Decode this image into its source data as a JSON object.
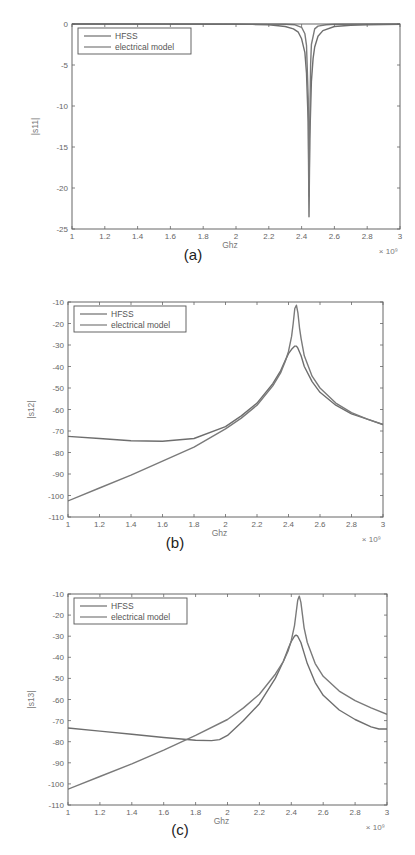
{
  "chart_data": [
    {
      "id": "a",
      "type": "line",
      "caption": "(a)",
      "xlabel": "Ghz",
      "ylabel": "|s11|",
      "x_multiplier": "× 10⁹",
      "xlim": [
        1,
        3
      ],
      "ylim": [
        -25,
        0
      ],
      "xticks": [
        1,
        1.2,
        1.4,
        1.6,
        1.8,
        2,
        2.2,
        2.4,
        2.6,
        2.8,
        3
      ],
      "xtick_labels": [
        "1",
        "1.2",
        "1.4",
        "1.6",
        "1.8",
        "2",
        "2.2",
        "2.4",
        "2.6",
        "2.8",
        "3"
      ],
      "yticks": [
        0,
        -5,
        -10,
        -15,
        -20,
        -25
      ],
      "ytick_labels": [
        "0",
        "-5",
        "-10",
        "-15",
        "-20",
        "-25"
      ],
      "legend": [
        "HFSS",
        "electrical model"
      ],
      "legend_position": "upper left",
      "grid": false,
      "series": [
        {
          "name": "HFSS",
          "color": "#6e6e6e",
          "x": [
            1,
            2.0,
            2.1,
            2.2,
            2.3,
            2.35,
            2.38,
            2.4,
            2.42,
            2.43,
            2.44,
            2.445,
            2.45,
            2.46,
            2.47,
            2.48,
            2.5,
            2.53,
            2.6,
            2.7,
            2.8,
            3
          ],
          "y": [
            0,
            -0.02,
            -0.05,
            -0.1,
            -0.3,
            -0.6,
            -1.0,
            -1.8,
            -3.5,
            -6,
            -12,
            -23.5,
            -14,
            -7,
            -4.2,
            -2.8,
            -1.5,
            -0.8,
            -0.3,
            -0.15,
            -0.08,
            -0.05
          ]
        },
        {
          "name": "electrical model",
          "color": "#7a7a7a",
          "x": [
            1,
            2.2,
            2.3,
            2.36,
            2.4,
            2.42,
            2.43,
            2.44,
            2.445,
            2.45,
            2.455,
            2.46,
            2.48,
            2.5,
            2.55,
            2.6,
            3
          ],
          "y": [
            0,
            -0.01,
            -0.03,
            -0.1,
            -0.4,
            -1.2,
            -2.6,
            -9,
            -21,
            -12,
            -5,
            -2.5,
            -0.6,
            -0.25,
            -0.08,
            -0.03,
            0
          ]
        }
      ]
    },
    {
      "id": "b",
      "type": "line",
      "caption": "(b)",
      "xlabel": "Ghz",
      "ylabel": "|s12|",
      "x_multiplier": "× 10⁹",
      "xlim": [
        1,
        3
      ],
      "ylim": [
        -110,
        -10
      ],
      "xticks": [
        1,
        1.2,
        1.4,
        1.6,
        1.8,
        2,
        2.2,
        2.4,
        2.6,
        2.8,
        3
      ],
      "xtick_labels": [
        "1",
        "1.2",
        "1.4",
        "1.6",
        "1.8",
        "2",
        "2.2",
        "2.4",
        "2.6",
        "2.8",
        "3"
      ],
      "yticks": [
        -10,
        -20,
        -30,
        -40,
        -50,
        -60,
        -70,
        -80,
        -90,
        -100,
        -110
      ],
      "ytick_labels": [
        "-10",
        "-20",
        "-30",
        "-40",
        "-50",
        "-60",
        "-70",
        "-80",
        "-90",
        "-100",
        "-110"
      ],
      "legend": [
        "HFSS",
        "electrical model"
      ],
      "legend_position": "upper left",
      "grid": false,
      "series": [
        {
          "name": "HFSS",
          "color": "#6e6e6e",
          "x": [
            1,
            1.2,
            1.4,
            1.6,
            1.8,
            2.0,
            2.1,
            2.2,
            2.3,
            2.35,
            2.38,
            2.4,
            2.42,
            2.44,
            2.45,
            2.46,
            2.48,
            2.5,
            2.55,
            2.6,
            2.7,
            2.8,
            2.9,
            3
          ],
          "y": [
            -72.5,
            -73.5,
            -74.5,
            -74.8,
            -73.5,
            -68,
            -63,
            -57,
            -48,
            -42,
            -37,
            -34,
            -32,
            -30.5,
            -30.5,
            -31.5,
            -35,
            -40,
            -47,
            -52,
            -58,
            -62,
            -64.5,
            -67
          ]
        },
        {
          "name": "electrical model",
          "color": "#7a7a7a",
          "x": [
            1,
            1.2,
            1.4,
            1.6,
            1.8,
            2.0,
            2.1,
            2.2,
            2.3,
            2.35,
            2.38,
            2.4,
            2.42,
            2.43,
            2.44,
            2.45,
            2.46,
            2.47,
            2.48,
            2.5,
            2.55,
            2.6,
            2.7,
            2.8,
            2.9,
            3
          ],
          "y": [
            -102.5,
            -96.5,
            -90.5,
            -84,
            -77.5,
            -69,
            -64,
            -58,
            -49,
            -43,
            -37.5,
            -33,
            -26,
            -20,
            -13,
            -11.5,
            -15,
            -22,
            -27,
            -35,
            -44.5,
            -50,
            -57,
            -61.5,
            -64.5,
            -67
          ]
        }
      ]
    },
    {
      "id": "c",
      "type": "line",
      "caption": "(c)",
      "xlabel": "Ghz",
      "ylabel": "|s13|",
      "x_multiplier": "× 10⁹",
      "xlim": [
        1,
        3
      ],
      "ylim": [
        -110,
        -10
      ],
      "xticks": [
        1,
        1.2,
        1.4,
        1.6,
        1.8,
        2,
        2.2,
        2.4,
        2.6,
        2.8,
        3
      ],
      "xtick_labels": [
        "1",
        "1.2",
        "1.4",
        "1.6",
        "1.8",
        "2",
        "2.2",
        "2.4",
        "2.6",
        "2.8",
        "3"
      ],
      "yticks": [
        -10,
        -20,
        -30,
        -40,
        -50,
        -60,
        -70,
        -80,
        -90,
        -100,
        -110
      ],
      "ytick_labels": [
        "-10",
        "-20",
        "-30",
        "-40",
        "-50",
        "-60",
        "-70",
        "-80",
        "-90",
        "-100",
        "-110"
      ],
      "legend": [
        "HFSS",
        "electrical model"
      ],
      "legend_position": "upper left",
      "grid": false,
      "series": [
        {
          "name": "HFSS",
          "color": "#6e6e6e",
          "x": [
            1,
            1.2,
            1.4,
            1.6,
            1.8,
            1.9,
            1.95,
            2.0,
            2.1,
            2.2,
            2.3,
            2.35,
            2.38,
            2.4,
            2.42,
            2.43,
            2.44,
            2.46,
            2.48,
            2.5,
            2.55,
            2.6,
            2.7,
            2.8,
            2.9,
            2.95,
            3
          ],
          "y": [
            -73.5,
            -75,
            -76.5,
            -78,
            -79.3,
            -79.5,
            -79,
            -77,
            -70,
            -62,
            -50,
            -42,
            -36,
            -32.5,
            -30,
            -29.5,
            -30,
            -33,
            -38,
            -43,
            -52,
            -58,
            -65,
            -69.5,
            -73,
            -74,
            -74
          ]
        },
        {
          "name": "electrical model",
          "color": "#7a7a7a",
          "x": [
            1,
            1.2,
            1.4,
            1.6,
            1.8,
            2.0,
            2.1,
            2.2,
            2.3,
            2.35,
            2.38,
            2.4,
            2.42,
            2.43,
            2.44,
            2.45,
            2.46,
            2.47,
            2.48,
            2.5,
            2.55,
            2.6,
            2.7,
            2.8,
            2.9,
            3
          ],
          "y": [
            -102.5,
            -96.5,
            -90.5,
            -84,
            -77,
            -69.5,
            -64,
            -57.5,
            -48,
            -42,
            -37,
            -32,
            -25,
            -19,
            -13,
            -11,
            -14,
            -20,
            -26,
            -33,
            -43,
            -49,
            -56,
            -60.5,
            -64,
            -67
          ]
        }
      ]
    }
  ],
  "layout": [
    {
      "plot": {
        "left": 72,
        "top": 24,
        "right": 400,
        "bottom": 229
      },
      "caption_pos": [
        193,
        260
      ],
      "legend_box": {
        "x": 78,
        "y": 28,
        "w": 113,
        "h": 26
      }
    },
    {
      "plot": {
        "left": 68,
        "top": 302,
        "right": 383,
        "bottom": 517
      },
      "caption_pos": [
        175,
        548
      ],
      "legend_box": {
        "x": 74,
        "y": 306,
        "w": 112,
        "h": 26
      }
    },
    {
      "plot": {
        "left": 68,
        "top": 594,
        "right": 387,
        "bottom": 805
      },
      "caption_pos": [
        180,
        835
      ],
      "legend_box": {
        "x": 74,
        "y": 598,
        "w": 113,
        "h": 26
      }
    }
  ]
}
